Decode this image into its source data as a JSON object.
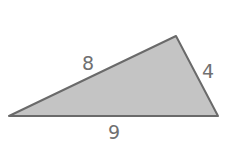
{
  "diagram": {
    "shape": "triangle",
    "fill_color": "#c4c4c4",
    "stroke_color": "#6a6a6a",
    "label_color": "#707070",
    "side_labels": {
      "left_side": "8",
      "right_side": "4",
      "bottom_side": "9"
    }
  }
}
